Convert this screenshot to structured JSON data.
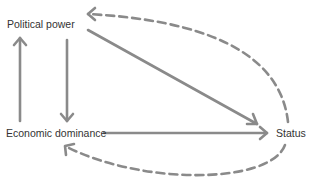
{
  "diagram": {
    "nodes": {
      "political_power": "Political power",
      "economic_dominance": "Economic dominance",
      "status": "Status"
    },
    "edges": [
      {
        "from": "Economic dominance",
        "to": "Political power",
        "style": "solid"
      },
      {
        "from": "Political power",
        "to": "Economic dominance",
        "style": "solid"
      },
      {
        "from": "Political power",
        "to": "Status",
        "style": "solid"
      },
      {
        "from": "Economic dominance",
        "to": "Status",
        "style": "solid"
      },
      {
        "from": "Status",
        "to": "Political power",
        "style": "dashed"
      },
      {
        "from": "Status",
        "to": "Economic dominance",
        "style": "dashed"
      }
    ],
    "colors": {
      "edge": "#8a8a8a",
      "text": "#333333",
      "background": "#ffffff"
    }
  }
}
